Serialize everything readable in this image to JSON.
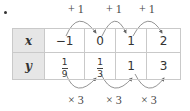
{
  "table": {
    "rows": [
      {
        "label": "x",
        "values": [
          {
            "type": "int",
            "text": "−1"
          },
          {
            "type": "int",
            "text": "0"
          },
          {
            "type": "int",
            "text": "1"
          },
          {
            "type": "int",
            "text": "2"
          }
        ]
      },
      {
        "label": "y",
        "values": [
          {
            "type": "frac",
            "num": "1",
            "den": "9"
          },
          {
            "type": "frac",
            "num": "1",
            "den": "3"
          },
          {
            "type": "int",
            "text": "1"
          },
          {
            "type": "int",
            "text": "3"
          }
        ]
      }
    ]
  },
  "top_ops": [
    "+ 1",
    "+ 1",
    "+ 1"
  ],
  "bottom_ops": [
    "× 3",
    "× 3",
    "× 3"
  ],
  "colors": {
    "border": "#c9c9c9",
    "header_bg": "#e6e6e6",
    "arrow": "#666666"
  }
}
